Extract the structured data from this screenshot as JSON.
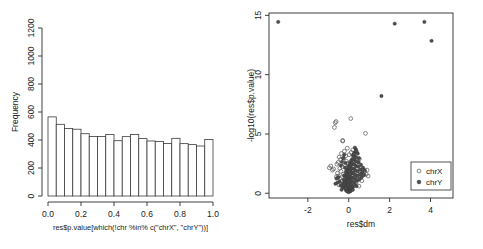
{
  "figure": {
    "background": "#ffffff",
    "panel_count": 2
  },
  "chart_data": [
    {
      "type": "bar",
      "id": "pvalue-histogram",
      "title": "",
      "xlabel": "res$p.value[which(!chr %in% c(\"chrX\", \"chrY\"))]",
      "ylabel": "Frequency",
      "xlim": [
        0.0,
        1.0
      ],
      "ylim": [
        0,
        1200
      ],
      "xticks": [
        "0.0",
        "0.2",
        "0.4",
        "0.6",
        "0.8",
        "1.0"
      ],
      "xtick_values": [
        0.0,
        0.2,
        0.4,
        0.6,
        0.8,
        1.0
      ],
      "yticks": [
        "0",
        "200",
        "400",
        "600",
        "800",
        "1000",
        "1200"
      ],
      "ytick_values": [
        0,
        200,
        400,
        600,
        800,
        1000,
        1200
      ],
      "grid": false,
      "bin_width": 0.05,
      "bin_starts": [
        0.0,
        0.05,
        0.1,
        0.15,
        0.2,
        0.25,
        0.3,
        0.35,
        0.4,
        0.45,
        0.5,
        0.55,
        0.6,
        0.65,
        0.7,
        0.75,
        0.8,
        0.85,
        0.9,
        0.95
      ],
      "categories": [
        "0.00-0.05",
        "0.05-0.10",
        "0.10-0.15",
        "0.15-0.20",
        "0.20-0.25",
        "0.25-0.30",
        "0.30-0.35",
        "0.35-0.40",
        "0.40-0.45",
        "0.45-0.50",
        "0.50-0.55",
        "0.55-0.60",
        "0.60-0.65",
        "0.65-0.70",
        "0.70-0.75",
        "0.75-0.80",
        "0.80-0.85",
        "0.85-0.90",
        "0.90-0.95",
        "0.95-1.00"
      ],
      "values": [
        565,
        512,
        482,
        477,
        445,
        425,
        425,
        440,
        395,
        424,
        440,
        410,
        393,
        389,
        375,
        412,
        374,
        367,
        357,
        403
      ],
      "bar_fill": "#ffffff",
      "bar_stroke": "#3a3a3a"
    },
    {
      "type": "scatter",
      "id": "volcano-plot",
      "title": "",
      "xlabel": "res$dm",
      "ylabel": "-log10(res$p.value)",
      "xlim": [
        -3.9,
        5.1
      ],
      "ylim": [
        -0.4,
        15.2
      ],
      "xticks": [
        "-2",
        "0",
        "2",
        "4"
      ],
      "xtick_values": [
        -2,
        0,
        2,
        4
      ],
      "yticks": [
        "0",
        "5",
        "10",
        "15"
      ],
      "ytick_values": [
        0,
        5,
        10,
        15
      ],
      "grid": false,
      "legend_position": "bottom-right",
      "series": [
        {
          "name": "chrX",
          "marker": "open-circle",
          "color": "#555555",
          "points": [
            [
              -0.95,
              2.15
            ],
            [
              -0.88,
              2.3
            ],
            [
              -0.8,
              1.95
            ],
            [
              -0.74,
              2.05
            ],
            [
              -0.7,
              5.55
            ],
            [
              -0.66,
              5.95
            ],
            [
              -0.62,
              6.05
            ],
            [
              -0.58,
              2.45
            ],
            [
              -0.55,
              1.7
            ],
            [
              -0.52,
              2.6
            ],
            [
              -0.5,
              1.45
            ],
            [
              -0.47,
              3.05
            ],
            [
              -0.44,
              2.1
            ],
            [
              -0.42,
              1.25
            ],
            [
              -0.4,
              2.85
            ],
            [
              -0.38,
              1.85
            ],
            [
              -0.36,
              3.35
            ],
            [
              -0.34,
              1.05
            ],
            [
              -0.32,
              2.25
            ],
            [
              -0.3,
              4.45
            ],
            [
              -0.29,
              4.4
            ],
            [
              -0.27,
              1.6
            ],
            [
              -0.25,
              2.95
            ],
            [
              -0.23,
              0.85
            ],
            [
              -0.21,
              3.55
            ],
            [
              -0.19,
              2.4
            ],
            [
              -0.17,
              1.3
            ],
            [
              -0.15,
              3.15
            ],
            [
              -0.13,
              0.65
            ],
            [
              -0.11,
              2.7
            ],
            [
              -0.09,
              1.9
            ],
            [
              -0.07,
              3.8
            ],
            [
              -0.05,
              1.15
            ],
            [
              -0.03,
              2.55
            ],
            [
              -0.01,
              0.95
            ],
            [
              0.02,
              3.25
            ],
            [
              0.04,
              1.75
            ],
            [
              0.06,
              2.35
            ],
            [
              0.08,
              0.75
            ],
            [
              0.1,
              6.3
            ],
            [
              0.12,
              3.45
            ],
            [
              0.14,
              1.5
            ],
            [
              0.16,
              2.8
            ],
            [
              0.18,
              0.55
            ],
            [
              0.2,
              3.65
            ],
            [
              0.22,
              1.95
            ],
            [
              0.24,
              2.2
            ],
            [
              0.26,
              1.1
            ],
            [
              0.28,
              3.0
            ],
            [
              0.3,
              1.65
            ],
            [
              0.33,
              2.5
            ],
            [
              0.36,
              0.9
            ],
            [
              0.39,
              2.05
            ],
            [
              0.42,
              1.4
            ],
            [
              0.45,
              2.65
            ],
            [
              0.48,
              1.2
            ],
            [
              0.52,
              2.9
            ],
            [
              0.55,
              1.8
            ],
            [
              0.58,
              1.35
            ],
            [
              0.62,
              2.15
            ],
            [
              0.66,
              1.7
            ],
            [
              0.7,
              2.0
            ],
            [
              0.74,
              1.55
            ],
            [
              0.78,
              1.85
            ],
            [
              0.82,
              5.05
            ],
            [
              0.86,
              1.6
            ],
            [
              0.9,
              1.95
            ],
            [
              0.95,
              1.45
            ],
            [
              -0.6,
              1.4
            ],
            [
              -0.48,
              0.7
            ],
            [
              0.5,
              0.6
            ],
            [
              0.64,
              1.05
            ]
          ]
        },
        {
          "name": "chrY",
          "marker": "filled-circle",
          "color": "#4d4d4d",
          "points": [
            [
              -3.45,
              14.45
            ],
            [
              2.25,
              14.3
            ],
            [
              3.7,
              14.45
            ],
            [
              4.05,
              12.85
            ],
            [
              1.6,
              8.2
            ],
            [
              0.35,
              3.7
            ],
            [
              -0.35,
              0.3
            ],
            [
              -0.3,
              0.55
            ],
            [
              -0.28,
              0.85
            ],
            [
              -0.25,
              1.15
            ],
            [
              -0.23,
              1.5
            ],
            [
              -0.21,
              0.45
            ],
            [
              -0.19,
              0.75
            ],
            [
              -0.17,
              1.05
            ],
            [
              -0.15,
              1.4
            ],
            [
              -0.14,
              1.8
            ],
            [
              -0.13,
              0.25
            ],
            [
              -0.12,
              0.6
            ],
            [
              -0.11,
              0.95
            ],
            [
              -0.1,
              1.3
            ],
            [
              -0.09,
              1.65
            ],
            [
              -0.08,
              2.0
            ],
            [
              -0.07,
              0.4
            ],
            [
              -0.06,
              0.8
            ],
            [
              -0.05,
              1.2
            ],
            [
              -0.04,
              1.55
            ],
            [
              -0.03,
              1.9
            ],
            [
              -0.02,
              2.25
            ],
            [
              -0.01,
              0.35
            ],
            [
              0.0,
              0.7
            ],
            [
              0.01,
              1.1
            ],
            [
              0.02,
              1.45
            ],
            [
              0.03,
              1.85
            ],
            [
              0.04,
              2.2
            ],
            [
              0.05,
              2.55
            ],
            [
              0.06,
              0.5
            ],
            [
              0.07,
              0.9
            ],
            [
              0.08,
              1.25
            ],
            [
              0.09,
              1.6
            ],
            [
              0.1,
              2.05
            ],
            [
              0.11,
              2.4
            ],
            [
              0.12,
              2.75
            ],
            [
              0.13,
              0.65
            ],
            [
              0.14,
              1.0
            ],
            [
              0.15,
              1.35
            ],
            [
              0.16,
              1.75
            ],
            [
              0.17,
              2.1
            ],
            [
              0.18,
              2.5
            ],
            [
              0.19,
              2.9
            ],
            [
              0.2,
              3.2
            ],
            [
              0.21,
              0.55
            ],
            [
              0.22,
              0.95
            ],
            [
              0.23,
              1.3
            ],
            [
              0.24,
              1.7
            ],
            [
              0.25,
              2.05
            ],
            [
              0.26,
              2.45
            ],
            [
              0.27,
              2.85
            ],
            [
              0.28,
              3.15
            ],
            [
              0.29,
              3.45
            ],
            [
              0.3,
              0.8
            ],
            [
              0.31,
              1.2
            ],
            [
              0.32,
              1.55
            ],
            [
              0.33,
              1.95
            ],
            [
              0.34,
              2.3
            ],
            [
              0.35,
              2.7
            ],
            [
              0.36,
              3.05
            ],
            [
              0.38,
              0.6
            ],
            [
              0.4,
              1.05
            ],
            [
              0.42,
              1.45
            ],
            [
              0.44,
              1.85
            ],
            [
              0.46,
              2.25
            ],
            [
              0.48,
              2.6
            ],
            [
              0.5,
              2.95
            ],
            [
              0.52,
              1.15
            ],
            [
              0.55,
              1.6
            ],
            [
              0.58,
              2.0
            ],
            [
              0.6,
              2.4
            ],
            [
              0.63,
              1.35
            ],
            [
              0.66,
              1.75
            ],
            [
              0.7,
              2.15
            ],
            [
              0.74,
              1.55
            ],
            [
              0.78,
              1.95
            ],
            [
              -0.4,
              0.65
            ],
            [
              -0.45,
              1.0
            ],
            [
              -0.5,
              1.35
            ],
            [
              -0.55,
              0.9
            ],
            [
              -0.6,
              1.25
            ],
            [
              -0.65,
              0.8
            ],
            [
              -0.38,
              2.35
            ],
            [
              -0.33,
              2.65
            ],
            [
              -0.27,
              2.95
            ],
            [
              -0.22,
              3.25
            ],
            [
              -0.18,
              2.15
            ],
            [
              -0.16,
              2.55
            ],
            [
              0.44,
              3.35
            ],
            [
              0.38,
              3.55
            ],
            [
              0.3,
              3.85
            ],
            [
              0.26,
              3.3
            ],
            [
              -0.05,
              0.15
            ],
            [
              0.05,
              0.15
            ],
            [
              0.0,
              0.1
            ],
            [
              0.1,
              0.2
            ],
            [
              -0.1,
              0.2
            ],
            [
              0.15,
              0.4
            ],
            [
              -0.15,
              0.4
            ],
            [
              0.2,
              0.3
            ]
          ]
        }
      ],
      "legend": [
        {
          "label": "chrX",
          "marker": "open-circle",
          "color": "#555555"
        },
        {
          "label": "chrY",
          "marker": "filled-circle",
          "color": "#4d4d4d"
        }
      ]
    }
  ]
}
